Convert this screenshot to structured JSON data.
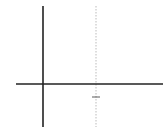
{
  "panel_label": "b)",
  "colors": {
    "grid": "#c8c8c8",
    "axis": "#222222",
    "curve": "#777777",
    "asymptote": "#bbbbbb",
    "equation": "#888888"
  },
  "chart_data": {
    "type": "line",
    "title": "",
    "xlabel": "θ",
    "ylabel": "y",
    "legend": "y = tan θ",
    "x_ticks": [
      {
        "value": 1.5708,
        "label": "π/2"
      }
    ],
    "y_ticks": [
      {
        "value": 4,
        "label": "4"
      },
      {
        "value": 2,
        "label": "2"
      },
      {
        "value": 0,
        "label": "0"
      },
      {
        "value": -2,
        "label": "-2"
      }
    ],
    "xlim": [
      -2,
      9.3
    ],
    "ylim": [
      -3.3,
      6
    ],
    "grid": true,
    "asymptote": {
      "x": 1.5708,
      "style": "dotted"
    },
    "series": [
      {
        "name": "y = tan θ",
        "x": [
          0,
          0.3,
          0.6,
          0.8,
          1.0,
          1.1,
          1.2,
          1.3,
          1.35,
          1.4
        ],
        "y": [
          0,
          0.31,
          0.68,
          1.03,
          1.56,
          1.96,
          2.57,
          3.6,
          4.46,
          5.8
        ]
      }
    ]
  },
  "labels": {
    "y_axis": "y",
    "x_axis": "θ",
    "equation": "y = tan θ",
    "tick_4": "4",
    "tick_2": "2",
    "tick_0": "0",
    "tick_neg2": "−2",
    "pi": "π",
    "two": "2"
  }
}
